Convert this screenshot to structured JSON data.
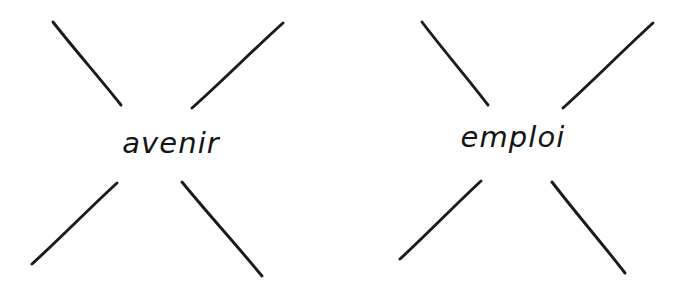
{
  "canvas": {
    "width": 684,
    "height": 297,
    "background_color": "#ffffff",
    "ink_color": "#1b1b1b",
    "style": "hand-drawn pen sketch"
  },
  "diagrams": [
    {
      "id": "left",
      "name": "starburst-avenir",
      "center_word": "avenir",
      "ray_count": 4,
      "rays": [
        {
          "name": "ray-upper-left",
          "x1": 53,
          "y1": 22,
          "x2": 121,
          "y2": 105
        },
        {
          "name": "ray-upper-right",
          "x1": 192,
          "y1": 108,
          "x2": 283,
          "y2": 23
        },
        {
          "name": "ray-lower-left",
          "x1": 32,
          "y1": 264,
          "x2": 117,
          "y2": 183
        },
        {
          "name": "ray-lower-right",
          "x1": 182,
          "y1": 182,
          "x2": 262,
          "y2": 276
        }
      ]
    },
    {
      "id": "right",
      "name": "starburst-emploi",
      "center_word": "emploi",
      "ray_count": 4,
      "rays": [
        {
          "name": "ray-upper-left",
          "x1": 80,
          "y1": 22,
          "x2": 146,
          "y2": 105
        },
        {
          "name": "ray-upper-right",
          "x1": 221,
          "y1": 108,
          "x2": 311,
          "y2": 23
        },
        {
          "name": "ray-lower-left",
          "x1": 58,
          "y1": 259,
          "x2": 139,
          "y2": 181
        },
        {
          "name": "ray-lower-right",
          "x1": 210,
          "y1": 182,
          "x2": 283,
          "y2": 273
        }
      ]
    }
  ]
}
